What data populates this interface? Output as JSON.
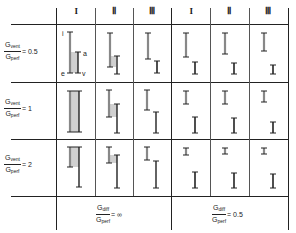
{
  "column_groups": [
    {
      "columns": [
        "I",
        "II",
        "III"
      ],
      "footer": {
        "num": "G",
        "num_sub": "diff",
        "den": "G",
        "den_sub": "perf",
        "value": "= ∞"
      }
    },
    {
      "columns": [
        "I",
        "II",
        "III"
      ],
      "footer": {
        "num": "G",
        "num_sub": "diff",
        "den": "G",
        "den_sub": "perf",
        "value": "= 0.5"
      }
    }
  ],
  "column_headers": [
    "I",
    "Ⅱ",
    "Ⅲ",
    "I",
    "Ⅱ",
    "Ⅲ"
  ],
  "rows": [
    {
      "num": "G",
      "num_sub": "vent",
      "den": "G",
      "den_sub": "perf",
      "value": "= 0.5"
    },
    {
      "num": "G",
      "num_sub": "vent",
      "den": "G",
      "den_sub": "perf",
      "value": "= 1"
    },
    {
      "num": "G",
      "num_sub": "vent",
      "den": "G",
      "den_sub": "perf",
      "value": "= 2"
    }
  ],
  "bar_labels": {
    "i": "i",
    "e": "e",
    "a": "a",
    "v": "v"
  },
  "colors": {
    "line": "#222222",
    "gray_bar": "#8a8a8a",
    "dark_bar": "#1a1a1a",
    "hatch": "#777777"
  }
}
